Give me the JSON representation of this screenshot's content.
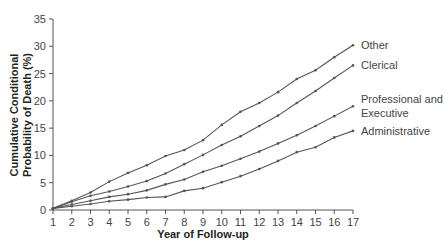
{
  "chart_data": {
    "type": "line",
    "title": "",
    "xlabel": "Year of Follow-up",
    "ylabel": [
      "Cumulative Conditional",
      "Probability of Death (%)"
    ],
    "xlim": [
      1,
      17
    ],
    "ylim": [
      0,
      35
    ],
    "x": [
      1,
      2,
      3,
      4,
      5,
      6,
      7,
      8,
      9,
      10,
      11,
      12,
      13,
      14,
      15,
      16,
      17
    ],
    "yticks": [
      0,
      5,
      10,
      15,
      20,
      25,
      30,
      35
    ],
    "grid": false,
    "legend_position": "right-inline",
    "series": [
      {
        "name": "Other",
        "label_lines": [
          "Other"
        ],
        "values": [
          0.3,
          1.7,
          3.2,
          5.2,
          6.8,
          8.2,
          9.9,
          11.0,
          12.8,
          15.6,
          18.0,
          19.6,
          21.6,
          24.0,
          25.6,
          28.0,
          30.2
        ]
      },
      {
        "name": "Clerical",
        "label_lines": [
          "Clerical"
        ],
        "values": [
          0.3,
          1.5,
          2.6,
          3.4,
          4.3,
          5.3,
          6.7,
          8.4,
          10.1,
          11.9,
          13.5,
          15.4,
          17.3,
          19.6,
          21.8,
          24.2,
          26.5
        ]
      },
      {
        "name": "Professional and Executive",
        "label_lines": [
          "Professional and",
          "Executive"
        ],
        "values": [
          0.3,
          1.0,
          1.7,
          2.4,
          2.9,
          3.6,
          4.7,
          5.6,
          7.0,
          8.1,
          9.4,
          10.7,
          12.2,
          13.7,
          15.4,
          17.2,
          19.0
        ]
      },
      {
        "name": "Administrative",
        "label_lines": [
          "Administrative"
        ],
        "values": [
          0.3,
          0.7,
          1.1,
          1.6,
          1.9,
          2.3,
          2.4,
          3.5,
          4.0,
          5.1,
          6.2,
          7.5,
          9.0,
          10.6,
          11.5,
          13.3,
          14.5
        ]
      }
    ]
  },
  "colors": {
    "line": "#555555",
    "axis": "#555555",
    "text": "#333333"
  }
}
